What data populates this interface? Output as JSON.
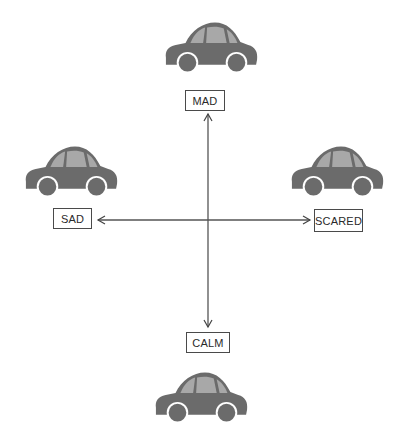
{
  "diagram": {
    "labels": {
      "top": "MAD",
      "left": "SAD",
      "right": "SCARED",
      "bottom": "CALM"
    },
    "colors": {
      "car_body": "#6b6b6b",
      "car_window": "#a8a8a8",
      "wheel_rim": "#ffffff",
      "axis_line": "#555555",
      "label_border": "#4a4a4a",
      "label_text": "#2a2a2a",
      "background": "#ffffff"
    },
    "cars": [
      {
        "id": "top",
        "icon": "car-icon"
      },
      {
        "id": "left",
        "icon": "car-icon"
      },
      {
        "id": "right",
        "icon": "car-icon"
      },
      {
        "id": "bottom",
        "icon": "car-icon"
      }
    ],
    "axes": [
      {
        "id": "vertical",
        "from": "CALM",
        "to": "MAD",
        "double_headed": true
      },
      {
        "id": "horizontal",
        "from": "SAD",
        "to": "SCARED",
        "double_headed": true
      }
    ]
  }
}
